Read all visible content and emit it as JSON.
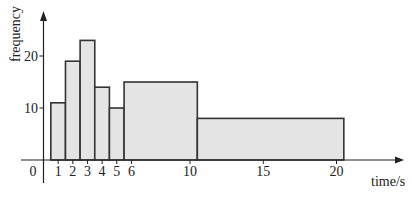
{
  "chart_data": {
    "type": "bar",
    "subtype": "histogram",
    "title": "",
    "xlabel": "time/s",
    "ylabel": "frequency",
    "origin_label": "0",
    "x_ticks": [
      1,
      2,
      3,
      4,
      5,
      6,
      10,
      15,
      20
    ],
    "y_ticks": [
      10,
      20
    ],
    "xlim": [
      -1.5,
      24
    ],
    "ylim": [
      0,
      27
    ],
    "grid": false,
    "legend": null,
    "bins": [
      {
        "from": 0.5,
        "to": 1.5,
        "frequency": 11
      },
      {
        "from": 1.5,
        "to": 2.5,
        "frequency": 19
      },
      {
        "from": 2.5,
        "to": 3.5,
        "frequency": 23
      },
      {
        "from": 3.5,
        "to": 4.5,
        "frequency": 14
      },
      {
        "from": 4.5,
        "to": 5.5,
        "frequency": 10
      },
      {
        "from": 5.5,
        "to": 10.5,
        "frequency": 15
      },
      {
        "from": 10.5,
        "to": 20.5,
        "frequency": 8
      }
    ],
    "categories": [
      "1",
      "2",
      "3",
      "4",
      "5",
      "6-10",
      "11-20"
    ],
    "values": [
      11,
      19,
      23,
      14,
      10,
      15,
      8
    ],
    "colors": {
      "bar_fill": "#e4e4e4",
      "bar_stroke": "#333333",
      "axis": "#222222"
    }
  },
  "labels": {
    "ylabel": "frequency",
    "xlabel": "time/s",
    "origin": "0"
  }
}
